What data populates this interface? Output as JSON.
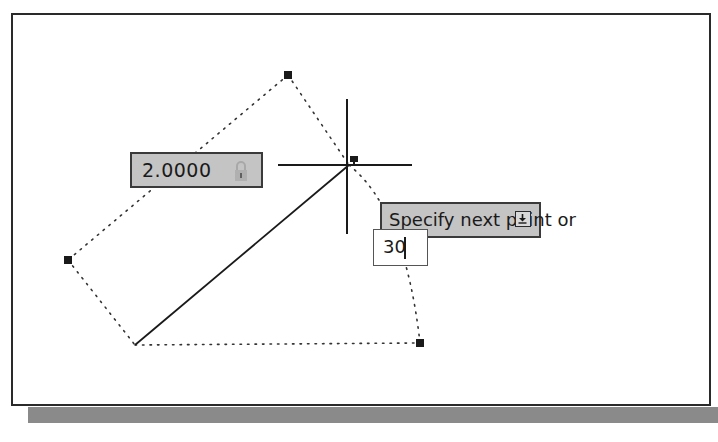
{
  "viewport": {
    "background": "#ffffff",
    "border_color": "#2a2a2a",
    "shadow_color": "#8a8a8a"
  },
  "drawing": {
    "points": {
      "top": [
        288,
        75
      ],
      "left": [
        68,
        260
      ],
      "origin": [
        135,
        345
      ],
      "bottom_right": [
        420,
        343
      ],
      "cursor": [
        349,
        165
      ]
    },
    "solid_line": {
      "from": [
        135,
        345
      ],
      "to": [
        349,
        165
      ]
    },
    "crosshair": {
      "center": [
        347,
        165
      ],
      "h_extent": [
        278,
        412
      ],
      "v_extent": [
        99,
        234
      ]
    }
  },
  "dimension_input": {
    "value": "2.0000",
    "icon": "lock-icon",
    "background": "#c4c4c4"
  },
  "tooltip": {
    "prompt": "Specify next point or",
    "icon": "down-arrow-icon",
    "background": "#c4c4c4"
  },
  "command_input": {
    "value": "30"
  }
}
